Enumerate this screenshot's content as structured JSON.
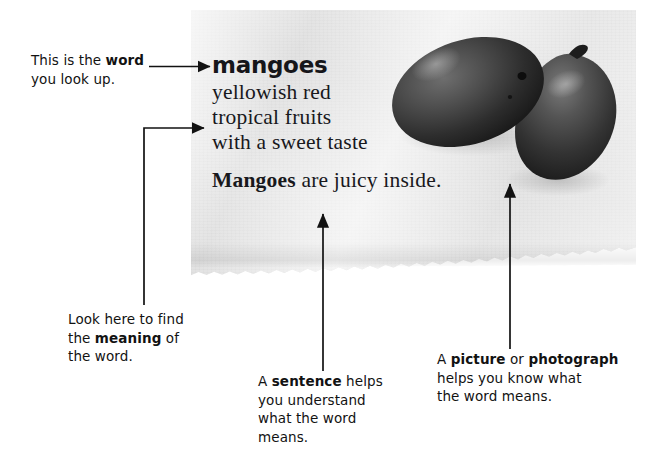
{
  "figure": {
    "type": "annotated-dictionary-entry-diagram",
    "background_color": "#ffffff",
    "paper_color": "#e9e9e9",
    "ink_color": "#121212"
  },
  "dictionary_entry": {
    "headword": "mangoes",
    "definition_lines": [
      "yellowish red",
      "tropical fruits",
      "with a sweet taste"
    ],
    "example_sentence": {
      "bold_part": "Mangoes",
      "rest": " are juicy inside."
    },
    "illustration_alt": "photograph of two mangoes"
  },
  "callouts": [
    {
      "id": "word",
      "lines": [
        [
          {
            "t": "This is the ",
            "b": false
          },
          {
            "t": "word",
            "b": true
          }
        ],
        [
          {
            "t": "you look up.",
            "b": false
          }
        ]
      ]
    },
    {
      "id": "meaning",
      "lines": [
        [
          {
            "t": "Look here to find",
            "b": false
          }
        ],
        [
          {
            "t": "the ",
            "b": false
          },
          {
            "t": "meaning",
            "b": true
          },
          {
            "t": " of",
            "b": false
          }
        ],
        [
          {
            "t": "the word.",
            "b": false
          }
        ]
      ]
    },
    {
      "id": "sentence",
      "lines": [
        [
          {
            "t": "A ",
            "b": false
          },
          {
            "t": "sentence",
            "b": true
          },
          {
            "t": " helps",
            "b": false
          }
        ],
        [
          {
            "t": "you understand",
            "b": false
          }
        ],
        [
          {
            "t": "what the word",
            "b": false
          }
        ],
        [
          {
            "t": "means.",
            "b": false
          }
        ]
      ]
    },
    {
      "id": "picture",
      "lines": [
        [
          {
            "t": "A ",
            "b": false
          },
          {
            "t": "picture",
            "b": true
          },
          {
            "t": " or ",
            "b": false
          },
          {
            "t": "photograph",
            "b": true
          }
        ],
        [
          {
            "t": "helps you know what",
            "b": false
          }
        ],
        [
          {
            "t": "the word means.",
            "b": false
          }
        ]
      ]
    }
  ]
}
